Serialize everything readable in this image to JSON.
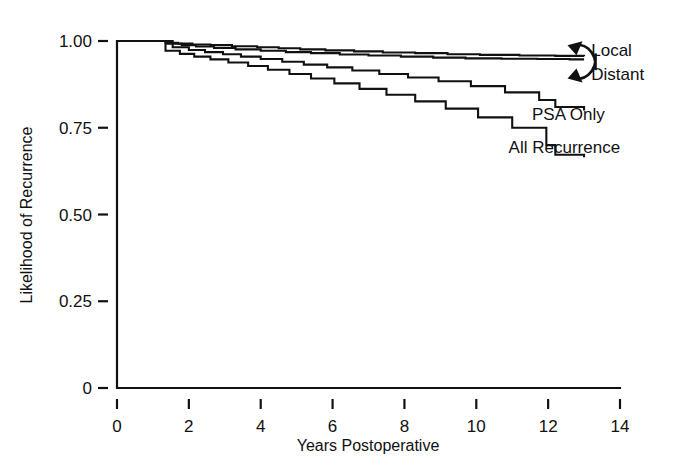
{
  "figure": {
    "background_color": "#ffffff",
    "line_color": "#111111"
  },
  "chart_data": {
    "type": "line",
    "title": "",
    "subtitle": "",
    "xlabel": "Years Postoperative",
    "ylabel": "Likelihood of Recurrence",
    "xlim": [
      0,
      14
    ],
    "ylim": [
      0,
      1.0
    ],
    "grid": false,
    "legend_position": "inline-right",
    "xticks": [
      0,
      2,
      4,
      6,
      8,
      10,
      12,
      14
    ],
    "xtick_labels": [
      "0",
      "2",
      "4",
      "6",
      "8",
      "10",
      "12",
      "14"
    ],
    "yticks": [
      0,
      0.25,
      0.5,
      0.75,
      1.0
    ],
    "ytick_labels": [
      "0",
      "0.25",
      "0.50",
      "0.75",
      "1.00"
    ],
    "step_style": "post",
    "series": [
      {
        "name": "Local",
        "label": "Local",
        "label_x": 13.2,
        "label_y": 0.975,
        "annotation": "curved-arrow",
        "x": [
          0,
          1.05,
          1.35,
          1.7,
          2.1,
          2.6,
          3.2,
          3.9,
          4.5,
          5.1,
          5.8,
          6.6,
          7.4,
          8.3,
          9.2,
          10.1,
          11.2,
          12.2,
          13.0
        ],
        "y": [
          1.0,
          1.0,
          0.995,
          0.993,
          0.99,
          0.988,
          0.985,
          0.982,
          0.979,
          0.976,
          0.973,
          0.97,
          0.967,
          0.965,
          0.962,
          0.96,
          0.958,
          0.957,
          0.956
        ]
      },
      {
        "name": "Distant",
        "label": "Distant",
        "label_x": 13.2,
        "label_y": 0.905,
        "annotation": "curved-arrow",
        "x": [
          0,
          1.05,
          1.4,
          1.8,
          2.2,
          2.7,
          3.3,
          4.0,
          4.7,
          5.4,
          6.2,
          7.0,
          7.9,
          8.8,
          9.7,
          10.7,
          11.7,
          12.6,
          13.0
        ],
        "y": [
          1.0,
          1.0,
          0.992,
          0.988,
          0.984,
          0.98,
          0.976,
          0.972,
          0.968,
          0.965,
          0.961,
          0.958,
          0.955,
          0.952,
          0.95,
          0.949,
          0.948,
          0.947,
          0.947
        ]
      },
      {
        "name": "PSA Only",
        "label": "PSA Only",
        "label_x": 11.55,
        "label_y": 0.79,
        "annotation": "none",
        "x": [
          0,
          1.0,
          1.55,
          2.0,
          2.45,
          2.95,
          3.45,
          4.0,
          4.6,
          5.2,
          5.85,
          6.55,
          7.3,
          8.1,
          8.95,
          9.85,
          10.8,
          11.75,
          12.2,
          13.0
        ],
        "y": [
          1.0,
          1.0,
          0.982,
          0.974,
          0.968,
          0.962,
          0.955,
          0.948,
          0.94,
          0.932,
          0.924,
          0.915,
          0.905,
          0.895,
          0.884,
          0.87,
          0.852,
          0.83,
          0.81,
          0.8
        ]
      },
      {
        "name": "All Recurrence",
        "label": "All Recurrence",
        "label_x": 10.9,
        "label_y": 0.695,
        "annotation": "none",
        "x": [
          0,
          0.95,
          1.35,
          1.75,
          2.15,
          2.6,
          3.1,
          3.65,
          4.2,
          4.8,
          5.4,
          6.05,
          6.75,
          7.5,
          8.3,
          9.15,
          10.05,
          11.0,
          11.95,
          12.2,
          13.0
        ],
        "y": [
          1.0,
          1.0,
          0.972,
          0.963,
          0.955,
          0.947,
          0.938,
          0.928,
          0.917,
          0.905,
          0.892,
          0.878,
          0.862,
          0.845,
          0.826,
          0.805,
          0.78,
          0.75,
          0.7,
          0.672,
          0.665
        ]
      }
    ]
  }
}
